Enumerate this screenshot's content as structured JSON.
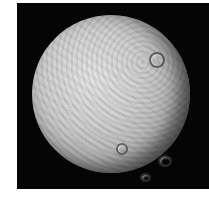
{
  "image": {
    "subject": "cratered icy moon",
    "background_color": "#050505",
    "surface_color": "#d0d0d0"
  },
  "craters": [
    {
      "x": 123,
      "y": 22,
      "r": 6
    },
    {
      "x": 93,
      "y": 128,
      "r": 4
    },
    {
      "x": 130,
      "y": 140,
      "r": 5
    },
    {
      "x": 112,
      "y": 158,
      "r": 3
    }
  ]
}
